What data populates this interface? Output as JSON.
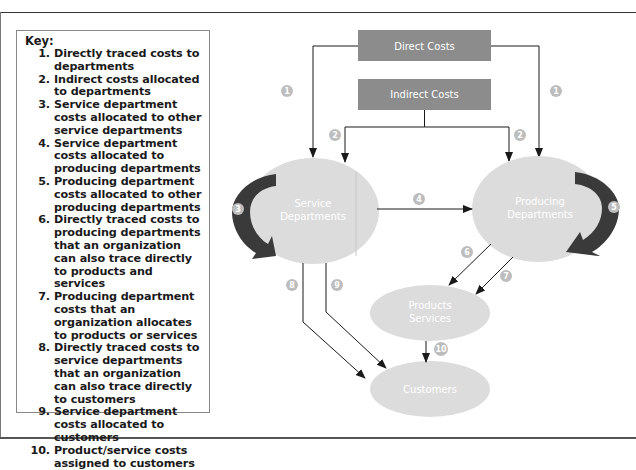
{
  "key": {
    "title": "Key:",
    "items": [
      {
        "num": "1.",
        "text": "Directly traced costs to departments"
      },
      {
        "num": "2.",
        "text": "Indirect costs allocated to departments"
      },
      {
        "num": "3.",
        "text": "Service department costs allocated to other service departments"
      },
      {
        "num": "4.",
        "text": "Service department costs allocated to producing departments"
      },
      {
        "num": "5.",
        "text": "Producing department costs allocated to other producing departments"
      },
      {
        "num": "6.",
        "text": "Directly traced costs to producing departments that an organization can also trace directly to products and services"
      },
      {
        "num": "7.",
        "text": "Producing department costs that an organization allocates to products or services"
      },
      {
        "num": "8.",
        "text": "Directly traced costs to service departments that an organization can also trace directly to customers"
      },
      {
        "num": "9.",
        "text": "Service department costs allocated to customers"
      },
      {
        "num": "10.",
        "text": "Product/service costs assigned to customers"
      }
    ]
  },
  "diagram": {
    "boxes": {
      "direct_costs": "Direct Costs",
      "indirect_costs": "Indirect Costs"
    },
    "nodes": {
      "service_line1": "Service",
      "service_line2": "Departments",
      "producing_line1": "Producing",
      "producing_line2": "Departments",
      "products_line1": "Products",
      "products_line2": "Services",
      "customers": "Customers"
    },
    "badges": {
      "b1_left": "1",
      "b1_right": "1",
      "b2_left": "2",
      "b2_right": "2",
      "b3": "3",
      "b4": "4",
      "b5": "5",
      "b6": "6",
      "b7": "7",
      "b8": "8",
      "b9": "9",
      "b10": "10"
    },
    "colors": {
      "box_fill": "#8c8c8c",
      "node_fill": "#dcdcdc",
      "badge_fill": "#bdbdbd",
      "loop_arrow": "#3a3a3a",
      "line": "#1a1a1a"
    }
  }
}
